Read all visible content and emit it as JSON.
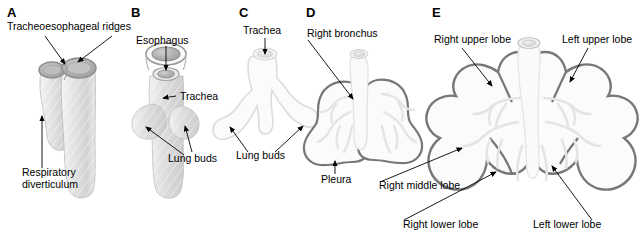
{
  "figure": {
    "background_color": "#ffffff",
    "line_color": "#000000",
    "outline_gray": "#777777",
    "pale_gray": "#e2e2e2",
    "tissue_gray": "#d9d9d9"
  },
  "panels": [
    {
      "id": "A",
      "letter": "A",
      "labels": [
        {
          "name": "tracheoesophageal-ridges",
          "text": "Tracheoesophageal ridges"
        },
        {
          "name": "respiratory-diverticulum-line1",
          "text": "Respiratory"
        },
        {
          "name": "respiratory-diverticulum-line2",
          "text": "diverticulum"
        }
      ]
    },
    {
      "id": "B",
      "letter": "B",
      "labels": [
        {
          "name": "esophagus",
          "text": "Esophagus"
        },
        {
          "name": "trachea",
          "text": "Trachea"
        },
        {
          "name": "lung-buds",
          "text": "Lung buds"
        }
      ]
    },
    {
      "id": "C",
      "letter": "C",
      "labels": [
        {
          "name": "trachea",
          "text": "Trachea"
        },
        {
          "name": "lung-buds",
          "text": "Lung buds"
        }
      ]
    },
    {
      "id": "D",
      "letter": "D",
      "labels": [
        {
          "name": "right-bronchus",
          "text": "Right bronchus"
        },
        {
          "name": "pleura",
          "text": "Pleura"
        }
      ]
    },
    {
      "id": "E",
      "letter": "E",
      "labels": [
        {
          "name": "right-upper-lobe",
          "text": "Right upper lobe"
        },
        {
          "name": "left-upper-lobe",
          "text": "Left upper lobe"
        },
        {
          "name": "right-middle-lobe",
          "text": "Right middle lobe"
        },
        {
          "name": "right-lower-lobe",
          "text": "Right lower lobe"
        },
        {
          "name": "left-lower-lobe",
          "text": "Left lower lobe"
        }
      ]
    }
  ]
}
